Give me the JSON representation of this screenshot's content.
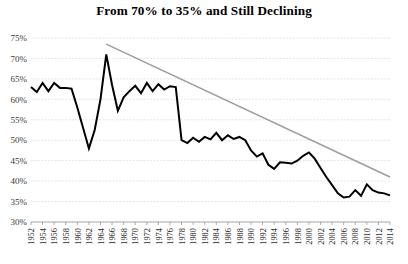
{
  "chart_data": {
    "type": "line",
    "title": "From 70% to 35% and Still Declining",
    "xlabel": "",
    "ylabel": "",
    "ylim": [
      30,
      75
    ],
    "xlim": [
      1952,
      2014
    ],
    "grid": true,
    "legend": false,
    "y_ticks": [
      "30%",
      "35%",
      "40%",
      "45%",
      "50%",
      "55%",
      "60%",
      "65%",
      "70%",
      "75%"
    ],
    "y_tick_values": [
      30,
      35,
      40,
      45,
      50,
      55,
      60,
      65,
      70,
      75
    ],
    "x_ticks": [
      "1952",
      "1954",
      "1956",
      "1958",
      "1960",
      "1962",
      "1964",
      "1966",
      "1968",
      "1970",
      "1972",
      "1974",
      "1976",
      "1978",
      "1980",
      "1982",
      "1984",
      "1986",
      "1988",
      "1990",
      "1992",
      "1994",
      "1996",
      "1998",
      "2000",
      "2002",
      "2004",
      "2006",
      "2008",
      "2010",
      "2012",
      "2014"
    ],
    "x_tick_values": [
      1952,
      1954,
      1956,
      1958,
      1960,
      1962,
      1964,
      1966,
      1968,
      1970,
      1972,
      1974,
      1976,
      1978,
      1980,
      1982,
      1984,
      1986,
      1988,
      1990,
      1992,
      1994,
      1996,
      1998,
      2000,
      2002,
      2004,
      2006,
      2008,
      2010,
      2012,
      2014
    ],
    "series": [
      {
        "name": "Value",
        "color": "#000000",
        "x": [
          1952,
          1953,
          1954,
          1955,
          1956,
          1957,
          1958,
          1959,
          1960,
          1961,
          1962,
          1963,
          1964,
          1965,
          1966,
          1967,
          1968,
          1969,
          1970,
          1971,
          1972,
          1973,
          1974,
          1975,
          1976,
          1977,
          1978,
          1979,
          1980,
          1981,
          1982,
          1983,
          1984,
          1985,
          1986,
          1987,
          1988,
          1989,
          1990,
          1991,
          1992,
          1993,
          1994,
          1995,
          1996,
          1997,
          1998,
          1999,
          2000,
          2001,
          2002,
          2003,
          2004,
          2005,
          2006,
          2007,
          2008,
          2009,
          2010,
          2011,
          2012,
          2013,
          2014
        ],
        "values": [
          63.0,
          61.8,
          64.0,
          62.0,
          64.0,
          62.8,
          62.8,
          62.6,
          58.0,
          53.0,
          48.0,
          52.5,
          60.0,
          71.0,
          63.5,
          57.2,
          60.5,
          62.0,
          63.3,
          61.5,
          64.0,
          62.0,
          63.7,
          62.4,
          63.2,
          63.0,
          50.0,
          49.3,
          50.6,
          49.6,
          50.8,
          50.2,
          51.8,
          50.0,
          51.2,
          50.3,
          50.8,
          50.0,
          47.5,
          46.0,
          46.8,
          44.0,
          43.0,
          44.6,
          44.5,
          44.3,
          45.0,
          46.2,
          47.0,
          45.5,
          43.2,
          41.0,
          39.0,
          37.0,
          36.0,
          36.2,
          37.8,
          36.4,
          39.2,
          37.8,
          37.2,
          37.0,
          36.5
        ]
      },
      {
        "name": "Trend",
        "color": "#9d9d9d",
        "x": [
          1965,
          2014
        ],
        "values": [
          73.5,
          41.0
        ]
      }
    ]
  },
  "plot": {
    "left": 31,
    "right": 390,
    "top": 38,
    "bottom": 222
  }
}
